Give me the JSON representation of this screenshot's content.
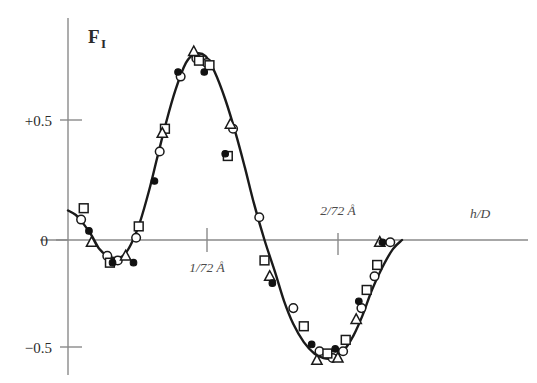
{
  "chart_data": {
    "type": "line",
    "title": "",
    "subtitle": "",
    "xlabel": "h/D",
    "ylabel": "F",
    "ylabel_subscript": "I",
    "grid": false,
    "legend_position": "none",
    "xlim": [
      0,
      2.6
    ],
    "ylim": [
      -0.62,
      0.95
    ],
    "y_ticks": [
      {
        "value": 0.5,
        "label": "+0.5"
      },
      {
        "value": 0.0,
        "label": "0"
      },
      {
        "value": -0.5,
        "label": "−0.5"
      }
    ],
    "x_ticks": [
      {
        "value": 1.0,
        "label": "1/72 Å"
      },
      {
        "value": 2.0,
        "label": "2/72 Å"
      }
    ],
    "annotations": [
      {
        "text": "1/72 Å",
        "x": 1.0,
        "y": -0.12
      },
      {
        "text": "2/72 Å",
        "x": 2.0,
        "y": 0.12
      },
      {
        "text": "h/D",
        "x": 2.45,
        "y": 0.1
      },
      {
        "text": "F",
        "x": 0.12,
        "y": 0.88
      }
    ],
    "curve": {
      "name": "fitted structure factor",
      "x": [
        0.0,
        0.06,
        0.12,
        0.18,
        0.24,
        0.3,
        0.36,
        0.42,
        0.48,
        0.55,
        0.62,
        0.68,
        0.75,
        0.82,
        0.9,
        0.97,
        1.05,
        1.12,
        1.2,
        1.28,
        1.35,
        1.42,
        1.5,
        1.58,
        1.65,
        1.72,
        1.8,
        1.88,
        1.95,
        2.02,
        2.1,
        2.18,
        2.25,
        2.32,
        2.4,
        2.48,
        2.55
      ],
      "y": [
        0.13,
        0.11,
        0.07,
        0.02,
        -0.04,
        -0.07,
        -0.08,
        -0.07,
        -0.02,
        0.08,
        0.22,
        0.36,
        0.52,
        0.66,
        0.78,
        0.82,
        0.81,
        0.74,
        0.62,
        0.47,
        0.32,
        0.16,
        0.0,
        -0.14,
        -0.27,
        -0.37,
        -0.45,
        -0.5,
        -0.52,
        -0.52,
        -0.49,
        -0.42,
        -0.33,
        -0.22,
        -0.12,
        -0.04,
        0.0
      ]
    },
    "series": [
      {
        "name": "open circle dataset",
        "marker": "open-circle",
        "points": [
          {
            "x": 0.1,
            "y": 0.09
          },
          {
            "x": 0.3,
            "y": -0.07
          },
          {
            "x": 0.38,
            "y": -0.09
          },
          {
            "x": 0.52,
            "y": 0.01
          },
          {
            "x": 0.7,
            "y": 0.39
          },
          {
            "x": 0.86,
            "y": 0.72
          },
          {
            "x": 0.98,
            "y": 0.8
          },
          {
            "x": 1.06,
            "y": 0.78
          },
          {
            "x": 1.26,
            "y": 0.49
          },
          {
            "x": 1.46,
            "y": 0.1
          },
          {
            "x": 1.72,
            "y": -0.3
          },
          {
            "x": 1.92,
            "y": -0.49
          },
          {
            "x": 2.02,
            "y": -0.52
          },
          {
            "x": 2.1,
            "y": -0.49
          },
          {
            "x": 2.24,
            "y": -0.3
          },
          {
            "x": 2.34,
            "y": -0.16
          },
          {
            "x": 2.46,
            "y": -0.01
          }
        ]
      },
      {
        "name": "filled circle dataset",
        "marker": "filled-circle",
        "points": [
          {
            "x": 0.16,
            "y": 0.04
          },
          {
            "x": 0.34,
            "y": -0.1
          },
          {
            "x": 0.5,
            "y": -0.1
          },
          {
            "x": 0.66,
            "y": 0.26
          },
          {
            "x": 0.84,
            "y": 0.74
          },
          {
            "x": 1.04,
            "y": 0.74
          },
          {
            "x": 1.2,
            "y": 0.38
          },
          {
            "x": 1.56,
            "y": -0.19
          },
          {
            "x": 1.86,
            "y": -0.46
          },
          {
            "x": 2.04,
            "y": -0.48
          },
          {
            "x": 2.22,
            "y": -0.27
          },
          {
            "x": 2.4,
            "y": -0.01
          }
        ]
      },
      {
        "name": "open square dataset",
        "marker": "open-square",
        "points": [
          {
            "x": 0.12,
            "y": 0.14
          },
          {
            "x": 0.32,
            "y": -0.1
          },
          {
            "x": 0.54,
            "y": 0.06
          },
          {
            "x": 0.74,
            "y": 0.49
          },
          {
            "x": 1.0,
            "y": 0.79
          },
          {
            "x": 1.08,
            "y": 0.77
          },
          {
            "x": 1.22,
            "y": 0.37
          },
          {
            "x": 1.5,
            "y": -0.09
          },
          {
            "x": 1.8,
            "y": -0.38
          },
          {
            "x": 1.98,
            "y": -0.5
          },
          {
            "x": 2.12,
            "y": -0.44
          },
          {
            "x": 2.28,
            "y": -0.22
          },
          {
            "x": 2.36,
            "y": -0.11
          }
        ]
      },
      {
        "name": "open triangle dataset",
        "marker": "open-triangle",
        "points": [
          {
            "x": 0.18,
            "y": -0.01
          },
          {
            "x": 0.44,
            "y": -0.07
          },
          {
            "x": 0.72,
            "y": 0.47
          },
          {
            "x": 0.96,
            "y": 0.83
          },
          {
            "x": 1.24,
            "y": 0.51
          },
          {
            "x": 1.54,
            "y": -0.16
          },
          {
            "x": 1.9,
            "y": -0.53
          },
          {
            "x": 2.06,
            "y": -0.52
          },
          {
            "x": 2.2,
            "y": -0.35
          },
          {
            "x": 2.38,
            "y": -0.01
          }
        ]
      }
    ]
  }
}
